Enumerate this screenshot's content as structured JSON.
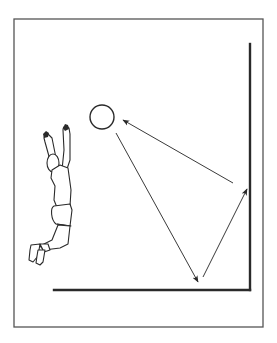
{
  "figure": {
    "colors": {
      "background": "#ffffff",
      "ink": "#2a2a2a",
      "frame": "#555555"
    },
    "elements": {
      "frame": "outer-border",
      "floor": "floor-line",
      "wall": "wall-line",
      "ball": "ball",
      "player": "jumping-player",
      "trajectory": [
        {
          "id": "ball-to-floor",
          "from": "ball",
          "to": "floor"
        },
        {
          "id": "floor-to-wall",
          "from": "floor",
          "to": "wall"
        },
        {
          "id": "wall-to-ball",
          "from": "wall",
          "to": "ball"
        }
      ]
    }
  }
}
